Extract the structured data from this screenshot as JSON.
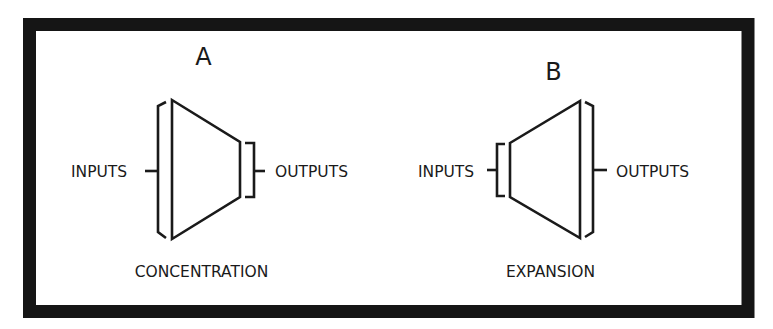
{
  "figure": {
    "panels": [
      {
        "id": "A",
        "letter": "A",
        "caption": "CONCENTRATION",
        "inputs_label": "INPUTS",
        "outputs_label": "OUTPUTS",
        "shape": "trapezoid narrowing from inputs to outputs"
      },
      {
        "id": "B",
        "letter": "B",
        "caption": "EXPANSION",
        "inputs_label": "INPUTS",
        "outputs_label": "OUTPUTS",
        "shape": "trapezoid widening from inputs to outputs"
      }
    ],
    "colors": {
      "ink": "#1a1a1a",
      "frame": "#151515",
      "background": "#ffffff"
    }
  }
}
